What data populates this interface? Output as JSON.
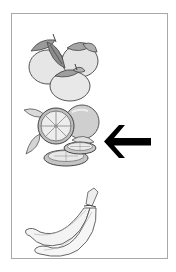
{
  "worksheet": {
    "items": [
      {
        "id": "persimmons",
        "label": "persimmons",
        "icon": "persimmon-icon",
        "selected": false
      },
      {
        "id": "oranges",
        "label": "oranges",
        "icon": "orange-icon",
        "selected": true
      },
      {
        "id": "bananas",
        "label": "bananas",
        "icon": "banana-icon",
        "selected": false
      }
    ],
    "pointer": {
      "icon": "arrow-left-icon",
      "points_to": "oranges",
      "color": "#000000"
    }
  },
  "colors": {
    "border": "#a8a8a8",
    "background": "#ffffff",
    "line": "#555555",
    "fill_light": "#e6e6e6",
    "fill_mid": "#bcbcbc",
    "leaf": "#8f8f8f"
  }
}
